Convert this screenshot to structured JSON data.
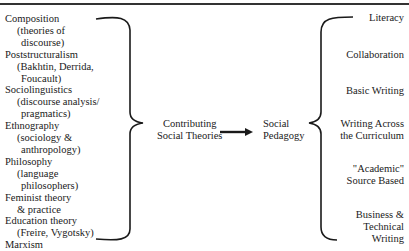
{
  "left_items": [
    {
      "label": "Composition",
      "sub": [
        "(theories of",
        "discourse)"
      ]
    },
    {
      "label": "Poststructuralism",
      "sub": [
        "(Bakhtin, Derrida,",
        "Foucault)"
      ]
    },
    {
      "label": "Sociolinguistics",
      "sub": [
        "(discourse analysis/",
        "pragmatics)"
      ]
    },
    {
      "label": "Ethnography",
      "sub": [
        "(sociology &",
        "anthropology)"
      ]
    },
    {
      "label": "Philosophy",
      "sub": [
        "(language",
        "philosophers)"
      ]
    },
    {
      "label": "Feminist theory",
      "sub": [
        "& practice"
      ]
    },
    {
      "label": "Education theory",
      "sub": [
        "(Freire, Vygotsky)"
      ]
    },
    {
      "label": "Marxism",
      "sub": []
    }
  ],
  "center": {
    "source_line1": "Contributing",
    "source_line2": "Social Theories",
    "target_line1": "Social",
    "target_line2": "Pedagogy"
  },
  "right_items": [
    {
      "line1": "Literacy"
    },
    {
      "line1": "Collaboration"
    },
    {
      "line1": "Basic Writing"
    },
    {
      "line1": "Writing Across",
      "line2": "the Curriculum"
    },
    {
      "line1": "\"Academic\"",
      "line2": "Source Based"
    },
    {
      "line1": "Business &",
      "line2": "Technical",
      "line3": "Writing"
    }
  ]
}
